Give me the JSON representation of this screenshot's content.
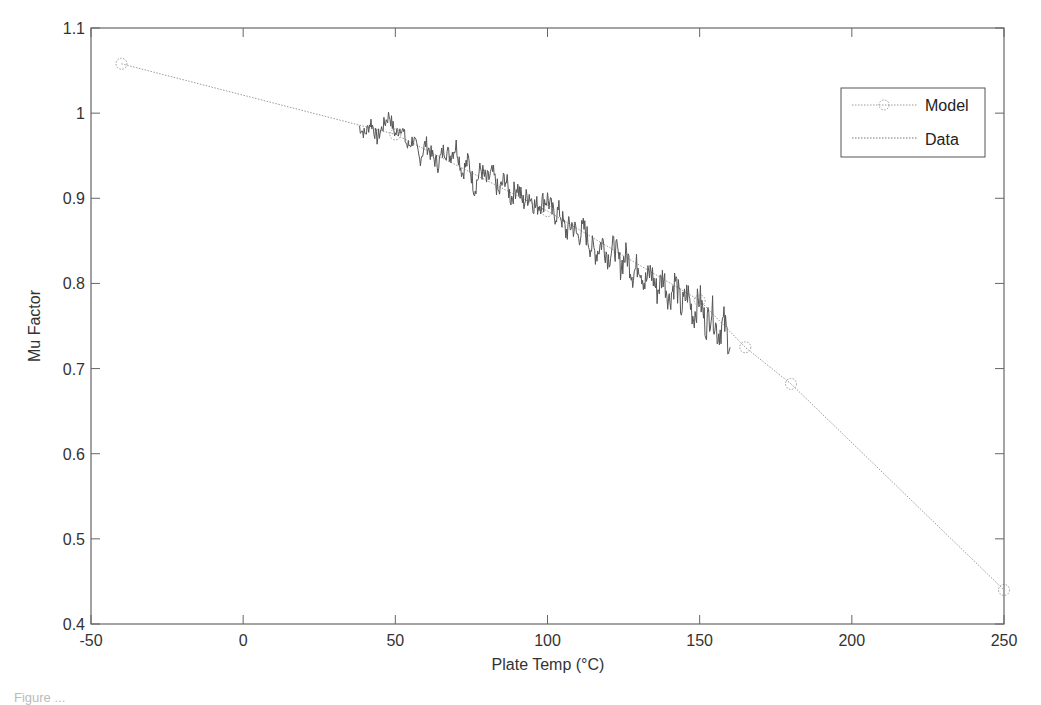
{
  "chart_data": {
    "type": "line",
    "title": "",
    "xlabel": "Plate Temp (°C)",
    "ylabel": "Mu Factor",
    "xlim": [
      -50,
      250
    ],
    "ylim": [
      0.4,
      1.1
    ],
    "xticks": [
      -50,
      0,
      50,
      100,
      150,
      200,
      250
    ],
    "yticks": [
      0.4,
      0.5,
      0.6,
      0.7,
      0.8,
      0.9,
      1.0,
      1.1
    ],
    "xtick_labels": [
      "-50",
      "0",
      "50",
      "100",
      "150",
      "200",
      "250"
    ],
    "ytick_labels": [
      "0.4",
      "0.5",
      "0.6",
      "0.7",
      "0.8",
      "0.9",
      "1",
      "1.1"
    ],
    "grid": false,
    "legend_position": "upper right",
    "series": [
      {
        "name": "Model",
        "style": "dotted line with circle markers",
        "color": "#9a9a9a",
        "x": [
          -40,
          50,
          100,
          150,
          165,
          180,
          250
        ],
        "y": [
          1.058,
          0.975,
          0.885,
          0.78,
          0.725,
          0.682,
          0.44
        ]
      },
      {
        "name": "Data",
        "style": "noisy line",
        "color": "#555555",
        "x": [
          38,
          40,
          42,
          44,
          46,
          48,
          50,
          52,
          54,
          56,
          58,
          60,
          62,
          64,
          66,
          68,
          70,
          72,
          74,
          76,
          78,
          80,
          82,
          84,
          86,
          88,
          90,
          92,
          94,
          96,
          98,
          100,
          102,
          104,
          106,
          108,
          110,
          112,
          114,
          116,
          118,
          120,
          122,
          124,
          126,
          128,
          130,
          132,
          134,
          136,
          138,
          140,
          142,
          144,
          146,
          148,
          150,
          152,
          154,
          156,
          158,
          160
        ],
        "y": [
          0.985,
          0.975,
          0.99,
          0.97,
          0.985,
          0.998,
          0.975,
          0.985,
          0.96,
          0.97,
          0.945,
          0.965,
          0.95,
          0.94,
          0.958,
          0.95,
          0.962,
          0.93,
          0.945,
          0.91,
          0.935,
          0.92,
          0.93,
          0.905,
          0.925,
          0.9,
          0.915,
          0.895,
          0.905,
          0.89,
          0.895,
          0.9,
          0.88,
          0.885,
          0.86,
          0.87,
          0.855,
          0.865,
          0.845,
          0.835,
          0.85,
          0.83,
          0.845,
          0.82,
          0.835,
          0.81,
          0.825,
          0.8,
          0.815,
          0.79,
          0.81,
          0.78,
          0.805,
          0.77,
          0.79,
          0.76,
          0.785,
          0.75,
          0.77,
          0.74,
          0.755,
          0.725
        ]
      }
    ]
  },
  "legend": {
    "items": [
      {
        "label": "Model"
      },
      {
        "label": "Data"
      }
    ]
  },
  "caption": "Figure ..."
}
